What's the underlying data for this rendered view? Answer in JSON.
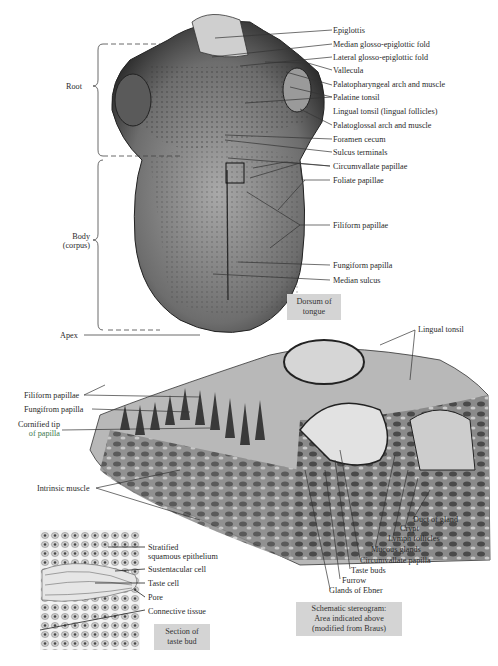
{
  "figure": {
    "dorsum_caption": [
      "Dorsum of",
      "tongue"
    ],
    "stereogram_caption": [
      "Schematic stereogram:",
      "Area indicated above",
      "(modified from Braus)"
    ],
    "taste_bud_caption": [
      "Section of",
      "taste bud"
    ]
  },
  "regions": {
    "root": "Root",
    "body": [
      "Body",
      "(corpus)"
    ],
    "apex": "Apex"
  },
  "dorsum_labels": [
    "Epiglottis",
    "Median glosso-epiglottic fold",
    "Lateral glosso-epiglottic fold",
    "Vallecula",
    "Palatopharyngeal arch and muscle",
    "Palatine tonsil",
    "Lingual tonsil (lingual follicles)",
    "Palatoglossal arch and muscle",
    "Foramen cecum",
    "Sulcus terminals",
    "Circumvallate papillae",
    "Foliate papillae",
    "Filiform papillae",
    "Fungiform papilla",
    "Median sulcus"
  ],
  "stereogram_left_labels": {
    "filiform": "Filiform papillae",
    "fungiform": "Fungifrom papilla",
    "cornified": [
      "Cornified tip",
      "of papilla"
    ],
    "intrinsic": "Intrinsic muscle"
  },
  "stereogram_right_labels": {
    "lingual_tonsil": "Lingual tonsil",
    "bottom": [
      "Duct of gland",
      "Crypt",
      "Lymph follicles",
      "Mucous glands",
      "Circumvallate papilla",
      "Taste buds",
      "Furrow",
      "Glands of Ebner"
    ]
  },
  "taste_bud_labels": [
    [
      "Stratified",
      "squamous epithelium"
    ],
    "Sustentacular cell",
    "Taste cell",
    "Pore",
    "Connective tissue"
  ],
  "colors": {
    "caption_bg": "#d4d4d4",
    "green_text": "#3e7a4e"
  }
}
